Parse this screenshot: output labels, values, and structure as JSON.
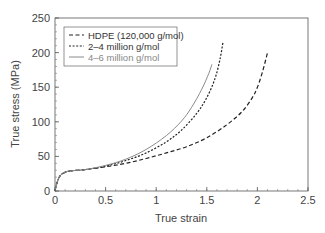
{
  "chart_data": {
    "type": "line",
    "title": "",
    "xlabel": "True strain",
    "ylabel": "True stress (MPa)",
    "xlim": [
      0,
      2.5
    ],
    "ylim": [
      0,
      250
    ],
    "x_ticks": [
      "0",
      "0.5",
      "1",
      "1.5",
      "2",
      "2.5"
    ],
    "y_ticks": [
      "0",
      "50",
      "100",
      "150",
      "200",
      "250"
    ],
    "grid": false,
    "legend_position": "upper left",
    "series": [
      {
        "name": "HDPE (120,000 g/mol)",
        "style": "dashed",
        "color": "#222222",
        "x": [
          0,
          0.02,
          0.05,
          0.1,
          0.15,
          0.3,
          0.5,
          0.7,
          0.9,
          1.1,
          1.3,
          1.5,
          1.7,
          1.85,
          1.95,
          2.0,
          2.05,
          2.1
        ],
        "y": [
          0,
          12,
          22,
          27,
          29,
          31,
          35,
          40,
          47,
          55,
          64,
          77,
          96,
          115,
          135,
          150,
          172,
          200
        ]
      },
      {
        "name": "2–4 million g/mol",
        "style": "dotted",
        "color": "#222222",
        "x": [
          0,
          0.02,
          0.05,
          0.1,
          0.15,
          0.3,
          0.5,
          0.7,
          0.9,
          1.1,
          1.25,
          1.4,
          1.5,
          1.58,
          1.63,
          1.66
        ],
        "y": [
          0,
          12,
          22,
          27,
          29,
          31,
          36,
          44,
          55,
          71,
          88,
          112,
          135,
          162,
          190,
          215
        ]
      },
      {
        "name": "4–6 million g/mol",
        "style": "solid",
        "color": "#8a8a8a",
        "x": [
          0,
          0.02,
          0.05,
          0.1,
          0.15,
          0.3,
          0.5,
          0.7,
          0.9,
          1.1,
          1.25,
          1.35,
          1.45,
          1.52,
          1.55
        ],
        "y": [
          0,
          12,
          22,
          27,
          29,
          31,
          37,
          46,
          60,
          80,
          101,
          121,
          147,
          170,
          183
        ]
      }
    ]
  }
}
